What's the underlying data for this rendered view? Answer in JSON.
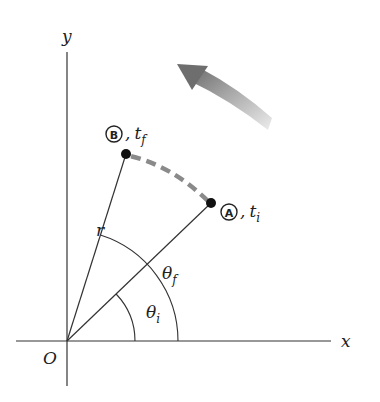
{
  "diagram": {
    "type": "circular-motion-angular-position",
    "labels": {
      "x_axis": "x",
      "y_axis": "y",
      "origin": "O",
      "radius": "r",
      "theta_f": "θ",
      "theta_f_sub": "f",
      "theta_i": "θ",
      "theta_i_sub": "i",
      "point_a_letter": "A",
      "point_a_time": "t",
      "point_a_time_sub": "i",
      "point_b_letter": "B",
      "point_b_time": "t",
      "point_b_time_sub": "f",
      "comma": ","
    },
    "points": {
      "origin": [
        67,
        341
      ],
      "A": [
        211,
        203
      ],
      "B": [
        126,
        154
      ]
    },
    "colors": {
      "line": "#333333",
      "path_dashed": "#8a8a8a",
      "arrow_dark": "#6e6e6e",
      "arrow_light": "#e6e6e6",
      "dot": "#111111"
    }
  }
}
